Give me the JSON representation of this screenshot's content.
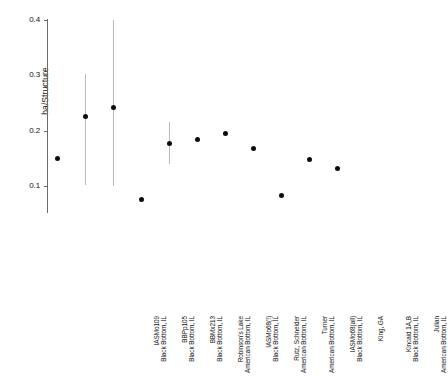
{
  "chart_data": {
    "type": "scatter",
    "title": "",
    "xlabel": "",
    "ylabel": "ha/Structure",
    "ylim": [
      0.0,
      0.42
    ],
    "yticks": [
      0.1,
      0.2,
      0.3,
      0.4
    ],
    "ytick_labels": [
      "0.1",
      "0.2",
      "0.3",
      "0.4"
    ],
    "grid": false,
    "legend": "none",
    "categories": [
      "IASMo109, Black Bottom, IL",
      "BBPp105, Black Bottom, IL",
      "BBMx213, Black Bottom, IL",
      "Robinson's Lake, American Bottom, IL",
      "IASMo68(!), Black Bottom, IL",
      "Rutz, Schneider, American Bottom, IL",
      "Turner, American Bottom, IL",
      "IASMo68(all), Black Bottom, IL",
      "King, GA",
      "Kincaid 1A,B, Black Bottom, IL",
      "Julian, American Bottom, IL"
    ],
    "values": [
      0.15,
      0.226,
      0.241,
      0.076,
      0.177,
      0.184,
      0.194,
      0.168,
      0.082,
      0.148,
      0.132
    ],
    "error_low": [
      null,
      0.102,
      0.1,
      null,
      0.139,
      null,
      null,
      null,
      null,
      null,
      null
    ],
    "error_high": [
      null,
      0.302,
      0.4,
      null,
      0.215,
      null,
      null,
      null,
      null,
      null,
      null
    ]
  }
}
